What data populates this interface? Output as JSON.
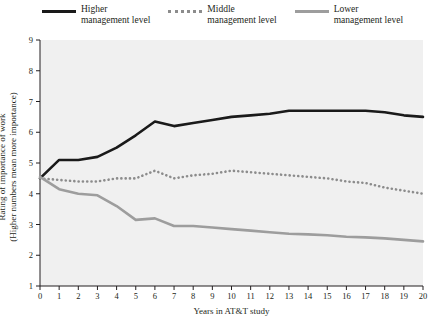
{
  "chart_data": {
    "type": "line",
    "title": "",
    "xlabel": "Years in AT&T study",
    "ylabel_line1": "Rating of importance of work",
    "ylabel_line2": "(Higher numbers mean more importance)",
    "x": [
      0,
      1,
      2,
      3,
      4,
      5,
      6,
      7,
      8,
      9,
      10,
      11,
      12,
      13,
      14,
      15,
      16,
      17,
      18,
      19,
      20
    ],
    "xticks": [
      "0",
      "1",
      "2",
      "3",
      "4",
      "5",
      "6",
      "7",
      "8",
      "9",
      "10",
      "11",
      "12",
      "13",
      "14",
      "15",
      "16",
      "17",
      "18",
      "19",
      "20"
    ],
    "yticks": [
      "1",
      "2",
      "3",
      "4",
      "5",
      "6",
      "7",
      "8",
      "9"
    ],
    "xlim": [
      0,
      20
    ],
    "ylim": [
      1,
      9
    ],
    "grid": false,
    "legend_position": "top-center",
    "series": [
      {
        "name": "Higher\nmanagement level",
        "color": "#1a1a1a",
        "style": "solid",
        "values": [
          4.5,
          5.1,
          5.1,
          5.2,
          5.5,
          5.9,
          6.35,
          6.2,
          6.3,
          6.4,
          6.5,
          6.55,
          6.6,
          6.7,
          6.7,
          6.7,
          6.7,
          6.7,
          6.65,
          6.55,
          6.5
        ]
      },
      {
        "name": "Middle\nmanagement level",
        "color": "#8c8c8c",
        "style": "dotted",
        "values": [
          4.5,
          4.45,
          4.4,
          4.4,
          4.5,
          4.5,
          4.75,
          4.5,
          4.6,
          4.65,
          4.75,
          4.7,
          4.65,
          4.6,
          4.55,
          4.5,
          4.4,
          4.35,
          4.2,
          4.1,
          4.0
        ]
      },
      {
        "name": "Lower\nmanagement level",
        "color": "#9d9d9d",
        "style": "solid",
        "values": [
          4.55,
          4.15,
          4.0,
          3.95,
          3.6,
          3.15,
          3.2,
          2.95,
          2.95,
          2.9,
          2.85,
          2.8,
          2.75,
          2.7,
          2.68,
          2.65,
          2.6,
          2.58,
          2.55,
          2.5,
          2.45
        ]
      }
    ]
  },
  "legend": [
    {
      "label": "Higher\nmanagement level",
      "swatch": "solid-black"
    },
    {
      "label": "Middle\nmanagement level",
      "swatch": "dotted-gray"
    },
    {
      "label": "Lower\nmanagement level",
      "swatch": "solid-gray"
    }
  ],
  "axes": {
    "x_title": "Years in AT&T study",
    "y_title_line1": "Rating of importance of work",
    "y_title_line2": "(Higher numbers mean more importance)"
  }
}
